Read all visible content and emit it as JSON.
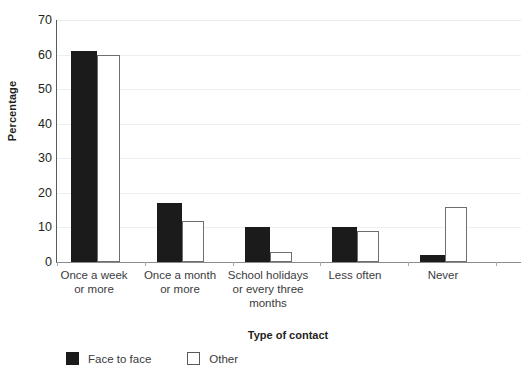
{
  "chart_data": {
    "type": "bar",
    "title": "",
    "subtitle": "",
    "xlabel": "Type of contact",
    "ylabel": "Percentage",
    "ylim": [
      0,
      70
    ],
    "yticks": [
      0,
      10,
      20,
      30,
      40,
      50,
      60,
      70
    ],
    "ytick_labels": [
      "0",
      "10",
      "20",
      "30",
      "40",
      "50",
      "60",
      "70"
    ],
    "grid": "horizontal",
    "legend_position": "bottom-left",
    "categories": [
      "Once a week or more",
      "Once a month or more",
      "School holidays or every three months",
      "Less often",
      "Never"
    ],
    "category_label_lines": [
      [
        "Once a week",
        "or more"
      ],
      [
        "Once a month",
        "or more"
      ],
      [
        "School holidays",
        "or every three",
        "months"
      ],
      [
        "Less often"
      ],
      [
        "Never"
      ]
    ],
    "series": [
      {
        "name": "Face to face",
        "color": "#1b1b1b",
        "style": "filled",
        "values": [
          61,
          17,
          10,
          10,
          2
        ]
      },
      {
        "name": "Other",
        "color": "#ffffff",
        "edge_color": "#6d6e71",
        "style": "outlined",
        "values": [
          60,
          12,
          3,
          9,
          16
        ]
      }
    ],
    "annotations": []
  },
  "legend": {
    "items": [
      {
        "label": "Face to face",
        "swatch": "black-filled-square"
      },
      {
        "label": "Other",
        "swatch": "white-outlined-square"
      }
    ]
  },
  "colors": {
    "bar_dark": "#1b1b1b",
    "bar_light": "#ffffff",
    "bar_light_edge": "#6d6e71",
    "gridline": "#eeeff1",
    "axis": "#58595b",
    "text": "#231f20",
    "text_muted": "#3b3b3d",
    "background": "#ffffff"
  }
}
